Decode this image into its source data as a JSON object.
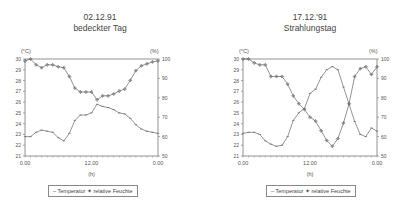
{
  "chart_data": [
    {
      "type": "line",
      "title": "02.12.91",
      "subtitle": "bedeckter Tag",
      "xlabel": "(h)",
      "ylabel": "(°C)",
      "ylabel_right": "(%)",
      "x_tick_labels": [
        "0.00",
        "12.00",
        "0.00"
      ],
      "x": [
        0,
        1,
        2,
        3,
        4,
        5,
        6,
        7,
        8,
        9,
        10,
        11,
        12,
        13,
        14,
        15,
        16,
        17,
        18,
        19,
        20,
        21,
        22,
        23,
        24
      ],
      "ylim": [
        21,
        30
      ],
      "ylim_right": [
        50,
        100
      ],
      "y_ticks": [
        21,
        22,
        23,
        24,
        25,
        26,
        27,
        28,
        29,
        30
      ],
      "y_ticks_right": [
        50,
        60,
        70,
        80,
        90,
        100
      ],
      "grid": false,
      "legend_position": "bottom",
      "series": [
        {
          "name": "Temperatur",
          "axis": "left",
          "marker": "tick",
          "values": [
            22.8,
            22.8,
            23.2,
            23.4,
            23.3,
            23.2,
            22.7,
            22.4,
            23.1,
            24.3,
            24.8,
            24.8,
            25.0,
            25.8,
            25.6,
            25.5,
            25.3,
            25.0,
            24.9,
            24.5,
            23.9,
            23.5,
            23.3,
            23.2,
            23.1
          ]
        },
        {
          "name": "relative Feuchte",
          "axis": "right",
          "marker": "diamond-plus",
          "values": [
            99,
            100,
            97,
            95.5,
            97,
            97,
            96,
            95.5,
            91,
            85,
            83,
            83,
            83,
            79,
            81,
            81,
            82,
            83.5,
            84.5,
            89,
            94,
            96.5,
            97.5,
            98.5,
            99
          ]
        }
      ]
    },
    {
      "type": "line",
      "title": "17.12.'91",
      "subtitle": "Strahlungstag",
      "xlabel": "(h)",
      "ylabel": "(°C)",
      "ylabel_right": "(%)",
      "x_tick_labels": [
        "0.00",
        "12.00",
        "0.00"
      ],
      "x": [
        0,
        1,
        2,
        3,
        4,
        5,
        6,
        7,
        8,
        9,
        10,
        11,
        12,
        13,
        14,
        15,
        16,
        17,
        18,
        19,
        20,
        21,
        22,
        23,
        24
      ],
      "ylim": [
        21,
        30
      ],
      "ylim_right": [
        50,
        100
      ],
      "y_ticks": [
        21,
        22,
        23,
        24,
        25,
        26,
        27,
        28,
        29,
        30
      ],
      "y_ticks_right": [
        50,
        60,
        70,
        80,
        90,
        100
      ],
      "grid": false,
      "legend_position": "bottom",
      "series": [
        {
          "name": "Temperatur",
          "axis": "left",
          "marker": "tick",
          "values": [
            23.1,
            23.2,
            23.2,
            23.0,
            22.4,
            22.1,
            21.9,
            22.0,
            22.8,
            24.3,
            25.0,
            25.4,
            26.8,
            27.2,
            28.3,
            29.0,
            29.3,
            29.0,
            27.4,
            25.8,
            24.2,
            23.0,
            22.8,
            23.6,
            23.3
          ]
        },
        {
          "name": "relative Feuchte",
          "axis": "right",
          "marker": "diamond-plus",
          "values": [
            100,
            100,
            98,
            97,
            97,
            91,
            91,
            91,
            87,
            81,
            77,
            74,
            70,
            68,
            63,
            58,
            55,
            59,
            67,
            77,
            91,
            95,
            96,
            92,
            96
          ]
        }
      ]
    }
  ],
  "panels": [
    {
      "title": "02.12.91",
      "subtitle": "bedeckter Tag",
      "unit_left": "(°C)",
      "unit_right": "(%)",
      "xunit": "(h)",
      "legend": {
        "temp": "Temperatur",
        "hum": "relative Feuchte"
      }
    },
    {
      "title": "17.12.'91",
      "subtitle": "Strahlungstag",
      "unit_left": "(°C)",
      "unit_right": "(%)",
      "xunit": "(h)",
      "legend": {
        "temp": "Temperatur",
        "hum": "relative Feuchte"
      }
    }
  ],
  "colors": {
    "axis": "#777777",
    "line": "#666666",
    "text": "#555555"
  }
}
